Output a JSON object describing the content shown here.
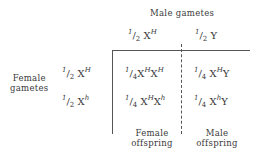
{
  "header": {
    "male_gametes_label": "Male gametes",
    "female_gametes_label_line1": "Female",
    "female_gametes_label_line2": "gametes"
  },
  "male_gametes": [
    {
      "frac_num": "1",
      "frac_den": "2",
      "allele": "X",
      "sup": "H",
      "sub": ""
    },
    {
      "frac_num": "1",
      "frac_den": "2",
      "allele": "Y",
      "sup": "",
      "sub": ""
    }
  ],
  "female_gametes": [
    {
      "frac_num": "1",
      "frac_den": "2",
      "allele": "X",
      "sup": "H"
    },
    {
      "frac_num": "1",
      "frac_den": "2",
      "allele": "X",
      "sup": "h"
    }
  ],
  "cells": [
    [
      {
        "frac_num": "1",
        "frac_den": "4",
        "g1": "X",
        "g1sup": "H",
        "g2": "X",
        "g2sup": "H"
      },
      {
        "frac_num": "1",
        "frac_den": "4",
        "g1": "X",
        "g1sup": "H",
        "g2": "Y",
        "g2sup": ""
      }
    ],
    [
      {
        "frac_num": "1",
        "frac_den": "4",
        "g1": "X",
        "g1sup": "H",
        "g2": "X",
        "g2sup": "h"
      },
      {
        "frac_num": "1",
        "frac_den": "4",
        "g1": "X",
        "g1sup": "h",
        "g2": "Y",
        "g2sup": ""
      }
    ]
  ],
  "footer": {
    "female_offspring_line1": "Female",
    "female_offspring_line2": "offspring",
    "male_offspring_line1": "Male",
    "male_offspring_line2": "offspring"
  }
}
